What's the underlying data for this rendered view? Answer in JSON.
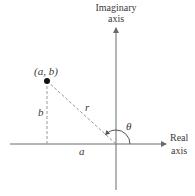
{
  "diagram": {
    "vertical_axis_label_line1": "Imaginary",
    "vertical_axis_label_line2": "axis",
    "horizontal_axis_label_line1": "Real",
    "horizontal_axis_label_line2": "axis",
    "point_label": "(a, b)",
    "radius_label": "r",
    "angle_label": "θ",
    "horizontal_leg_label": "a",
    "vertical_leg_label": "b",
    "colors": {
      "axis": "#6a6a6a",
      "dashed": "#9a9a9a",
      "point": "#111111",
      "text": "#3a3a3a"
    }
  }
}
